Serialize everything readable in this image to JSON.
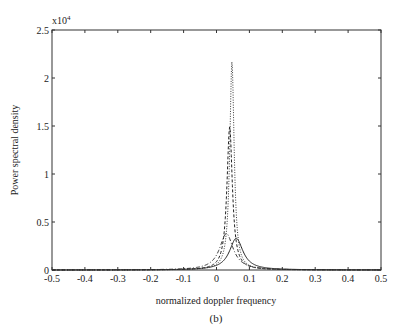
{
  "chart_data": {
    "type": "line",
    "title": "",
    "caption": "(b)",
    "xlabel": "normalized doppler frequency",
    "ylabel": "Power spectral density",
    "y_multiplier": "x10",
    "y_multiplier_exp": "4",
    "xlim": [
      -0.5,
      0.5
    ],
    "ylim": [
      0,
      2.5
    ],
    "x_ticks": [
      -0.5,
      -0.4,
      -0.3,
      -0.2,
      -0.1,
      0,
      0.1,
      0.2,
      0.3,
      0.4,
      0.5
    ],
    "x_tick_labels": [
      "-0.5",
      "-0.4",
      "-0.3",
      "-0.2",
      "-0.1",
      "0",
      "0.1",
      "0.2",
      "0.3",
      "0.4",
      "0.5"
    ],
    "y_ticks": [
      0,
      0.5,
      1,
      1.5,
      2,
      2.5
    ],
    "y_tick_labels": [
      "0",
      "0.5",
      "1",
      "1.5",
      "2",
      "2.5"
    ],
    "grid": false,
    "legend": null,
    "series": [
      {
        "name": "dotted",
        "style": "dotted",
        "peak_x": 0.047,
        "peak_y": 2.17,
        "half_width": 0.008,
        "x": [
          -0.5,
          -0.2,
          -0.1,
          -0.05,
          0,
          0.02,
          0.035,
          0.042,
          0.047,
          0.052,
          0.06,
          0.075,
          0.1,
          0.15,
          0.2,
          0.5
        ],
        "y": [
          0.0,
          0.01,
          0.03,
          0.06,
          0.18,
          0.45,
          1.1,
          1.7,
          2.17,
          1.7,
          0.9,
          0.35,
          0.12,
          0.04,
          0.02,
          0.0
        ]
      },
      {
        "name": "dashed",
        "style": "dashed",
        "peak_x": 0.04,
        "peak_y": 1.49,
        "half_width": 0.01,
        "x": [
          -0.5,
          -0.2,
          -0.1,
          -0.05,
          0,
          0.02,
          0.03,
          0.04,
          0.05,
          0.06,
          0.08,
          0.1,
          0.15,
          0.2,
          0.5
        ],
        "y": [
          0.0,
          0.01,
          0.04,
          0.08,
          0.25,
          0.6,
          1.05,
          1.49,
          1.05,
          0.6,
          0.25,
          0.12,
          0.04,
          0.02,
          0.0
        ]
      },
      {
        "name": "dash-dot",
        "style": "dashdot",
        "peak_x": 0.03,
        "peak_y": 0.38,
        "half_width": 0.025,
        "x": [
          -0.5,
          -0.2,
          -0.1,
          -0.05,
          0,
          0.02,
          0.03,
          0.04,
          0.06,
          0.08,
          0.1,
          0.15,
          0.2,
          0.5
        ],
        "y": [
          0.0,
          0.01,
          0.03,
          0.07,
          0.2,
          0.34,
          0.38,
          0.34,
          0.22,
          0.12,
          0.07,
          0.03,
          0.01,
          0.0
        ]
      },
      {
        "name": "solid",
        "style": "solid",
        "peak_x": 0.06,
        "peak_y": 0.33,
        "half_width": 0.025,
        "x": [
          -0.5,
          -0.2,
          -0.1,
          -0.05,
          0,
          0.03,
          0.05,
          0.06,
          0.07,
          0.09,
          0.12,
          0.15,
          0.2,
          0.3,
          0.5
        ],
        "y": [
          0.0,
          0.005,
          0.015,
          0.03,
          0.07,
          0.19,
          0.3,
          0.33,
          0.3,
          0.2,
          0.1,
          0.05,
          0.02,
          0.005,
          0.0
        ]
      }
    ]
  }
}
